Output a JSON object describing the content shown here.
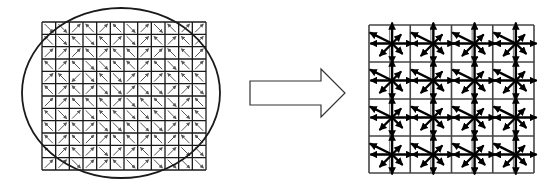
{
  "diagram": {
    "colors": {
      "stroke": "#1a1a1a",
      "cell_arrow": "#555555",
      "star": "#000000",
      "background": "#ffffff"
    },
    "left_grid": {
      "x": 42,
      "y": 22,
      "width": 164,
      "height": 148,
      "rows": 12,
      "cols": 12,
      "directions": [
        [
          "se",
          "se",
          "ne",
          "nw",
          "ne",
          "nw",
          "se",
          "ne",
          "se",
          "nw",
          "ne",
          "ne"
        ],
        [
          "nw",
          "se",
          "nw",
          "se",
          "nw",
          "ne",
          "se",
          "ne",
          "nw",
          "ne",
          "nw",
          "ne"
        ],
        [
          "ne",
          "ne",
          "ne",
          "nw",
          "ne",
          "nw",
          "nw",
          "ne",
          "ne",
          "nw",
          "nw",
          "ne"
        ],
        [
          "nw",
          "ne",
          "nw",
          "se",
          "se",
          "nw",
          "nw",
          "ne",
          "nw",
          "se",
          "nw",
          "ne"
        ],
        [
          "ne",
          "nw",
          "sw",
          "se",
          "nw",
          "se",
          "ne",
          "ne",
          "ne",
          "nw",
          "nw",
          "nw"
        ],
        [
          "nw",
          "ne",
          "nw",
          "ne",
          "se",
          "se",
          "ne",
          "se",
          "se",
          "ne",
          "ne",
          "se"
        ],
        [
          "ne",
          "ne",
          "nw",
          "nw",
          "nw",
          "ne",
          "se",
          "nw",
          "nw",
          "se",
          "ne",
          "nw"
        ],
        [
          "nw",
          "se",
          "ne",
          "se",
          "nw",
          "nw",
          "se",
          "se",
          "nw",
          "se",
          "se",
          "nw"
        ],
        [
          "nw",
          "ne",
          "nw",
          "ne",
          "se",
          "se",
          "nw",
          "se",
          "se",
          "ne",
          "ne",
          "nw"
        ],
        [
          "nw",
          "ne",
          "nw",
          "ne",
          "ne",
          "nw",
          "nw",
          "ne",
          "nw",
          "ne",
          "nw",
          "nw"
        ],
        [
          "nw",
          "ne",
          "nw",
          "ne",
          "se",
          "ne",
          "ne",
          "nw",
          "ne",
          "ne",
          "se",
          "se"
        ],
        [
          "ne",
          "ne",
          "se",
          "ne",
          "ne",
          "nw",
          "se",
          "ne",
          "se",
          "se",
          "se",
          "se"
        ]
      ]
    },
    "ellipse": {
      "cx": 121,
      "cy": 93,
      "rx": 99,
      "ry": 85
    },
    "block_arrow": {
      "points": [
        [
          250,
          81
        ],
        [
          321,
          81
        ],
        [
          321,
          69
        ],
        [
          345,
          93
        ],
        [
          321,
          117
        ],
        [
          321,
          105
        ],
        [
          250,
          105
        ]
      ]
    },
    "right_grid": {
      "x": 369,
      "y": 25,
      "width": 165,
      "height": 148,
      "blocks": 4,
      "cells_per_block": 2,
      "star_offset": [
        0.56,
        0.5
      ],
      "star_lengths": {
        "N": 20,
        "NE": 12,
        "E": 20,
        "SE": 14,
        "S": 19,
        "SW": 17,
        "W": 21,
        "NW": 24
      }
    }
  }
}
